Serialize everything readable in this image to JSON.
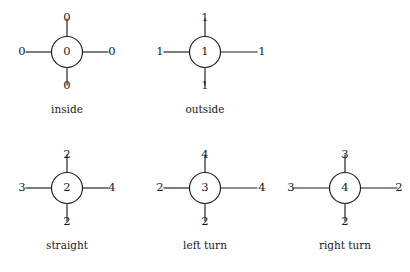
{
  "figure": {
    "background_color": "#ffffff",
    "ink_color": "#1a1a1a",
    "stroke_color": "#1c1c1c"
  },
  "diagrams": [
    {
      "id": "inside",
      "caption": "inside",
      "center_value": "0",
      "top_value": "0",
      "left_value": "0",
      "right_value": "0",
      "bottom_value": "0",
      "cx": 67,
      "cy": 52,
      "r": 15.5,
      "left_edge_len": 26,
      "right_edge_len": 26,
      "top_edge_len": 18,
      "bottom_edge_len": 18,
      "left_label_x": 22,
      "right_label_x": 112,
      "top_label_y": 18,
      "bottom_label_y": 86,
      "caption_x": 67,
      "caption_y": 110
    },
    {
      "id": "outside",
      "caption": "outside",
      "center_value": "1",
      "top_value": "1",
      "left_value": "1",
      "right_value": "1",
      "bottom_value": "1",
      "cx": 205,
      "cy": 52,
      "r": 15.5,
      "left_edge_len": 26,
      "right_edge_len": 37,
      "top_edge_len": 18,
      "bottom_edge_len": 18,
      "left_label_x": 160,
      "right_label_x": 262,
      "top_label_y": 18,
      "bottom_label_y": 86,
      "caption_x": 205,
      "caption_y": 110
    },
    {
      "id": "straight",
      "caption": "straight",
      "center_value": "2",
      "top_value": "2",
      "left_value": "3",
      "right_value": "4",
      "bottom_value": "2",
      "cx": 67,
      "cy": 188,
      "r": 15.5,
      "left_edge_len": 26,
      "right_edge_len": 26,
      "top_edge_len": 18,
      "bottom_edge_len": 18,
      "left_label_x": 22,
      "right_label_x": 112,
      "top_label_y": 155,
      "bottom_label_y": 222,
      "caption_x": 67,
      "caption_y": 246
    },
    {
      "id": "left-turn",
      "caption": "left turn",
      "center_value": "3",
      "top_value": "4",
      "left_value": "2",
      "right_value": "4",
      "bottom_value": "2",
      "cx": 205,
      "cy": 188,
      "r": 15.5,
      "left_edge_len": 26,
      "right_edge_len": 37,
      "top_edge_len": 18,
      "bottom_edge_len": 18,
      "left_label_x": 160,
      "right_label_x": 262,
      "top_label_y": 155,
      "bottom_label_y": 222,
      "caption_x": 205,
      "caption_y": 246
    },
    {
      "id": "right-turn",
      "caption": "right turn",
      "center_value": "4",
      "top_value": "3",
      "left_value": "3",
      "right_value": "2",
      "bottom_value": "2",
      "cx": 345,
      "cy": 188,
      "r": 15.5,
      "left_edge_len": 37,
      "right_edge_len": 37,
      "top_edge_len": 18,
      "bottom_edge_len": 18,
      "left_label_x": 291,
      "right_label_x": 399,
      "top_label_y": 155,
      "bottom_label_y": 222,
      "caption_x": 345,
      "caption_y": 246
    }
  ]
}
